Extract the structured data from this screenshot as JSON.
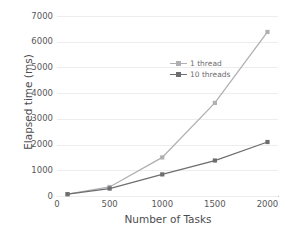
{
  "chart_data": {
    "type": "line",
    "title": "",
    "xlabel": "Number of Tasks",
    "ylabel": "Elapsed time (ms)",
    "x": [
      100,
      500,
      1000,
      1500,
      2000
    ],
    "xlim": [
      0,
      2100
    ],
    "ylim": [
      0,
      7000
    ],
    "xticks": [
      "0",
      "500",
      "1000",
      "1500",
      "2000"
    ],
    "xtick_values": [
      0,
      500,
      1000,
      1500,
      2000
    ],
    "yticks": [
      "0",
      "1000",
      "2000",
      "3000",
      "4000",
      "5000",
      "6000",
      "7000"
    ],
    "ytick_values": [
      0,
      1000,
      2000,
      3000,
      4000,
      5000,
      6000,
      7000
    ],
    "grid": true,
    "legend_position": "upper-left-inside",
    "series": [
      {
        "name": "1 thread",
        "color": "#b0b0b2",
        "marker": "square",
        "values": [
          70,
          350,
          1500,
          3620,
          6380
        ]
      },
      {
        "name": "10 threads",
        "color": "#6e6e70",
        "marker": "square",
        "values": [
          70,
          290,
          840,
          1380,
          2100
        ]
      }
    ]
  },
  "colors": {
    "background": "#ffffff",
    "grid": "#ededee",
    "axis": "#b9b9bb",
    "text": "#58585a"
  }
}
